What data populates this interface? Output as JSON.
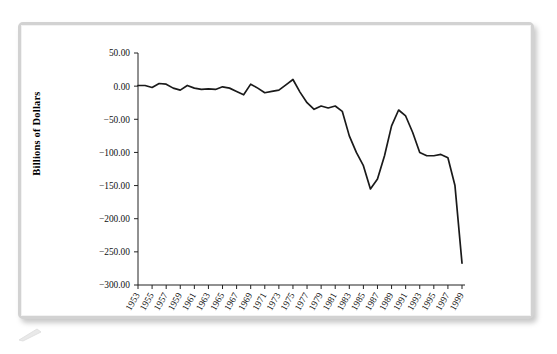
{
  "figure": {
    "frame_color": "#d2d2d2",
    "line_color": "#1a1a1a",
    "background": "#ffffff"
  },
  "chart_data": {
    "type": "line",
    "title": "",
    "xlabel": "",
    "ylabel": "Billions of Dollars",
    "ylim": [
      -300,
      50
    ],
    "ytick_values": [
      50,
      0,
      -50,
      -100,
      -150,
      -200,
      -250,
      -300
    ],
    "ytick_labels": [
      "50.00",
      "0.00",
      "−50.00",
      "−100.00",
      "−150.00",
      "−200.00",
      "−250.00",
      "−300.00"
    ],
    "xlim": [
      1953,
      1999
    ],
    "xtick_labels": [
      "1953",
      "1955",
      "1957",
      "1959",
      "1961",
      "1963",
      "1965",
      "1967",
      "1969",
      "1971",
      "1973",
      "1975",
      "1977",
      "1979",
      "1981",
      "1983",
      "1985",
      "1987",
      "1989",
      "1991",
      "1993",
      "1995",
      "1997",
      "1999"
    ],
    "xtick_values": [
      1953,
      1955,
      1957,
      1959,
      1961,
      1963,
      1965,
      1967,
      1969,
      1971,
      1973,
      1975,
      1977,
      1979,
      1981,
      1983,
      1985,
      1987,
      1989,
      1991,
      1993,
      1995,
      1997,
      1999
    ],
    "grid": false,
    "legend": null,
    "series": [
      {
        "name": "Federal Budget Surplus/Deficit",
        "x": [
          1953,
          1954,
          1955,
          1956,
          1957,
          1958,
          1959,
          1960,
          1961,
          1962,
          1963,
          1964,
          1965,
          1966,
          1967,
          1968,
          1969,
          1970,
          1971,
          1972,
          1973,
          1974,
          1975,
          1976,
          1977,
          1978,
          1979,
          1980,
          1981,
          1982,
          1983,
          1984,
          1985,
          1986,
          1987,
          1988,
          1989,
          1990,
          1991,
          1992,
          1993,
          1994,
          1995,
          1996,
          1997,
          1998,
          1999
        ],
        "values": [
          1,
          1,
          -2,
          4,
          3,
          -3,
          -6,
          1,
          -3,
          -5,
          -4,
          -5,
          -1,
          -3,
          -8,
          -13,
          3,
          -3,
          -10,
          -8,
          -6,
          2,
          10,
          -9,
          -25,
          -35,
          -30,
          -33,
          -30,
          -38,
          -75,
          -100,
          -120,
          -155,
          -140,
          -105,
          -60,
          -36,
          -45,
          -70,
          -100,
          -105,
          -105,
          -103,
          -108,
          -150,
          -267
        ]
      }
    ]
  },
  "axis_label": {
    "y_axis_title": "Billions of Dollars"
  }
}
